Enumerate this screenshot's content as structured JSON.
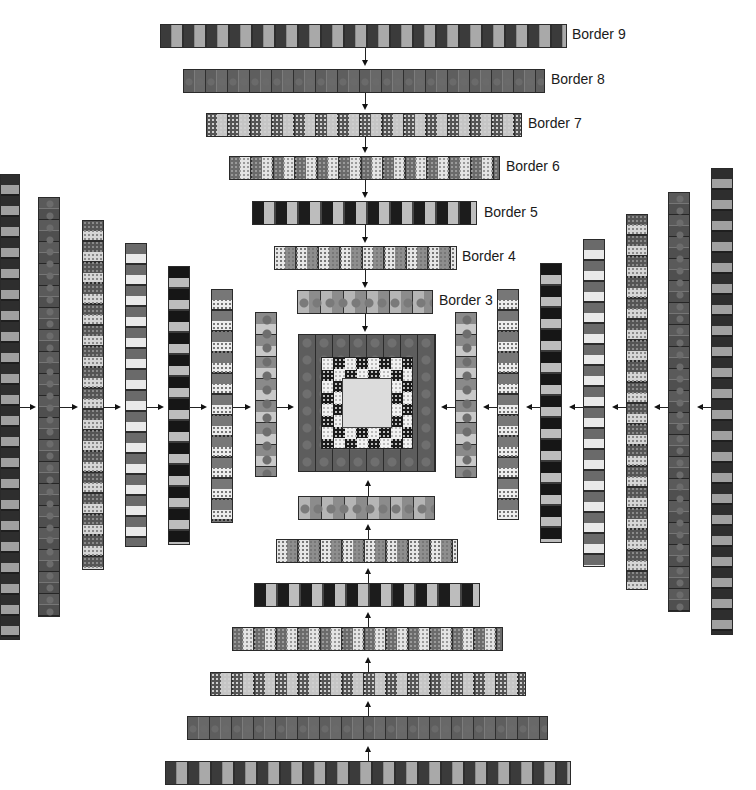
{
  "diagram": {
    "labels": {
      "border9": "Border 9",
      "border8": "Border 8",
      "border7": "Border 7",
      "border6": "Border 6",
      "border5": "Border 5",
      "border4": "Border 4",
      "border3": "Border 3"
    },
    "center": {
      "description": "Quilt center block with star ring"
    },
    "top_strips": [
      {
        "border": "Border 9",
        "pattern": "dark-light"
      },
      {
        "border": "Border 8",
        "pattern": "mottled"
      },
      {
        "border": "Border 7",
        "pattern": "dot-spot"
      },
      {
        "border": "Border 6",
        "pattern": "dots"
      },
      {
        "border": "Border 5",
        "pattern": "black-white"
      },
      {
        "border": "Border 4",
        "pattern": "dot-light"
      },
      {
        "border": "Border 3",
        "pattern": "spot"
      }
    ],
    "bottom_strips": [
      "spot",
      "dot-light",
      "black-white",
      "dots",
      "dot-spot",
      "mottled",
      "dark-light"
    ],
    "left_strips": [
      "dark-light",
      "mottled",
      "dot-spot",
      "dots",
      "black-white",
      "dot-light",
      "spot"
    ],
    "right_strips": [
      "spot",
      "dot-light",
      "black-white",
      "dots",
      "dot-spot",
      "mottled",
      "dark-light"
    ]
  }
}
